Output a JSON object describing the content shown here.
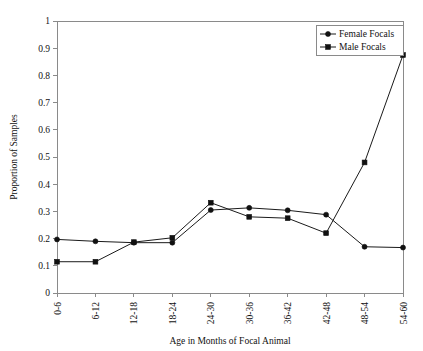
{
  "chart_data": {
    "type": "line",
    "title": "",
    "xlabel": "Age in Months of Focal Animal",
    "ylabel": "Proportion of Samples",
    "categories": [
      "0-6",
      "6-12",
      "12-18",
      "18-24",
      "24-30",
      "30-36",
      "36-42",
      "42-48",
      "48-54",
      "54-60"
    ],
    "ylim": [
      0,
      1
    ],
    "yticks": [
      "0",
      "0.1",
      "0.2",
      "0.3",
      "0.4",
      "0.5",
      "0.6",
      "0.7",
      "0.8",
      "0.9",
      "1"
    ],
    "ytick_values": [
      0,
      0.1,
      0.2,
      0.3,
      0.4,
      0.5,
      0.6,
      0.7,
      0.8,
      0.9,
      1
    ],
    "grid": false,
    "legend_position": "top-right",
    "series": [
      {
        "name": "Female Focals",
        "marker": "circle",
        "color": "#111111",
        "values": [
          0.197,
          0.19,
          0.185,
          0.185,
          0.305,
          0.313,
          0.304,
          0.288,
          0.17,
          0.167
        ]
      },
      {
        "name": "Male Focals",
        "marker": "square",
        "color": "#111111",
        "values": [
          0.115,
          0.115,
          0.187,
          0.203,
          0.332,
          0.28,
          0.275,
          0.22,
          0.48,
          0.875
        ]
      }
    ]
  },
  "legend": {
    "entries": [
      {
        "label": "Female Focals",
        "marker": "circle"
      },
      {
        "label": "Male Focals",
        "marker": "square"
      }
    ]
  }
}
